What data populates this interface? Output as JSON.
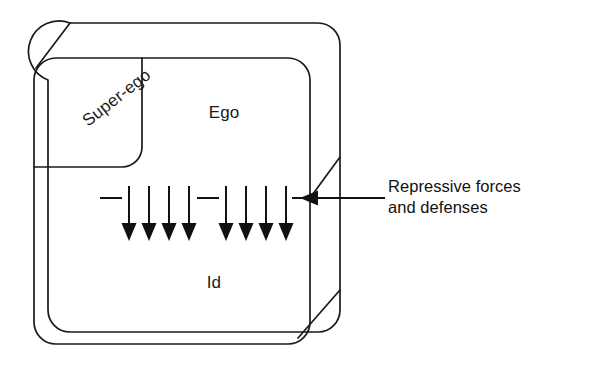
{
  "figure": {
    "name": "freud-structural-model",
    "background_color": "#ffffff",
    "line_color": "#1a1a1a",
    "arrow_color": "#111111"
  },
  "regions": {
    "superego": {
      "label": "Super-ego",
      "rotation_deg": -38
    },
    "ego": {
      "label": "Ego"
    },
    "id": {
      "label": "Id"
    }
  },
  "callout": {
    "label": "Repressive forces\nand defenses",
    "line_one": "Repressive forces",
    "line_two": "and defenses",
    "arrow_direction": "left"
  },
  "repression_arrows": {
    "count": 8,
    "direction": "down",
    "group_left_x": [
      129,
      149,
      169,
      189
    ],
    "group_right_x": [
      226,
      246,
      266,
      286
    ],
    "top_y": 186,
    "tip_y": 241
  },
  "barrier_dashes": {
    "count": 2,
    "y": 198,
    "segments": [
      {
        "x1": 100,
        "x2": 122
      },
      {
        "x1": 197,
        "x2": 219
      }
    ]
  },
  "geometry": {
    "back_box": {
      "x": 48,
      "y": 23,
      "width": 292,
      "height": 309,
      "radius": 22
    },
    "front_box": {
      "x": 34,
      "y": 58,
      "width": 276,
      "height": 286,
      "radius": 22
    },
    "superego_right_edge_x": 142,
    "superego_bottom_y": 167
  }
}
